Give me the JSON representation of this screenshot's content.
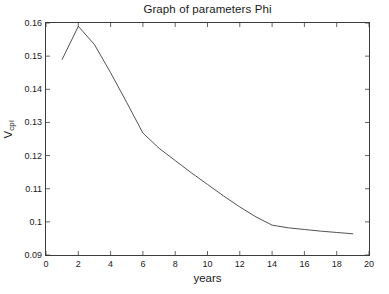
{
  "chart_data": {
    "type": "line",
    "title": "Graph of parameters Phi",
    "xlabel": "years",
    "ylabel": "V",
    "ylabel_subscript": "cpl",
    "ylabel_full": "V_cpl",
    "xlim": [
      0,
      20
    ],
    "ylim": [
      0.09,
      0.16
    ],
    "grid": false,
    "legend": null,
    "x_ticks": [
      0,
      2,
      4,
      6,
      8,
      10,
      12,
      14,
      16,
      18,
      20
    ],
    "x_tick_labels": [
      "0",
      "2",
      "4",
      "6",
      "8",
      "10",
      "12",
      "14",
      "16",
      "18",
      "20"
    ],
    "y_ticks": [
      0.09,
      0.1,
      0.11,
      0.12,
      0.13,
      0.14,
      0.15,
      0.16
    ],
    "y_tick_labels": [
      "0.09",
      "0.1",
      "0.11",
      "0.12",
      "0.13",
      "0.14",
      "0.15",
      "0.16"
    ],
    "x": [
      1,
      2,
      3,
      4,
      5,
      6,
      7,
      8,
      9,
      10,
      11,
      12,
      13,
      14,
      15,
      16,
      17,
      18,
      19
    ],
    "series": [
      {
        "name": "Phi",
        "color": "#404040",
        "values": [
          0.149,
          0.159,
          0.1535,
          0.145,
          0.136,
          0.1268,
          0.1222,
          0.1185,
          0.1148,
          0.1113,
          0.1078,
          0.1045,
          0.1015,
          0.099,
          0.0982,
          0.0977,
          0.0972,
          0.0968,
          0.0964
        ]
      }
    ]
  },
  "figure": {
    "background_color": "#ffffff",
    "axis_color": "#3c3c3c",
    "text_color": "#1a1a1a"
  }
}
